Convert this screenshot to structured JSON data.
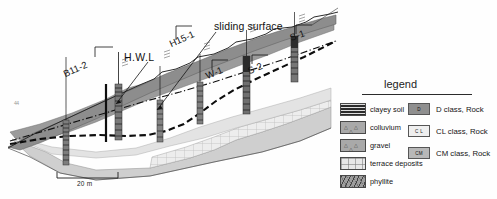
{
  "figure": {
    "type": "geological-cross-section",
    "boreholes": [
      {
        "id": "B11-2",
        "label": "B11-2"
      },
      {
        "id": "H15-1",
        "label": "H15-1"
      },
      {
        "id": "W-1",
        "label": "W-1"
      },
      {
        "id": "S-2",
        "label": "S-2"
      },
      {
        "id": "S-1",
        "label": "S-1"
      }
    ],
    "annotations": {
      "hwl": "H.W.L",
      "sliding_surface": "sliding surface",
      "speck": "44"
    },
    "scale_bar": {
      "label": "20 m"
    }
  },
  "legend": {
    "title": "legend",
    "materials": [
      {
        "swatch": "clayey-soil-swatch",
        "label": "clayey soil"
      },
      {
        "swatch": "colluvium-swatch",
        "label": "colluvium"
      },
      {
        "swatch": "gravel-swatch",
        "label": "gravel"
      },
      {
        "swatch": "terrace-deposits-swatch",
        "label": "terrace deposits"
      },
      {
        "swatch": "phyllite-swatch",
        "label": "phyllite"
      }
    ],
    "rock_classes": [
      {
        "code": "D",
        "label": "D class, Rock"
      },
      {
        "code": "C L",
        "label": "CL class, Rock"
      },
      {
        "code": "CM",
        "label": "CM class, Rock"
      }
    ]
  },
  "colors": {
    "clayey_soil": "#2c2c2c",
    "colluvium": "#a9a9a9",
    "gravel": "#a9a9a9",
    "terrace_deposits": "#e8e8e8",
    "phyllite": "#9e9e9e",
    "d_class": "#8f8f8f",
    "cl_class": "#efefef",
    "cm_class": "#b8b8b8",
    "line": "#111111"
  }
}
